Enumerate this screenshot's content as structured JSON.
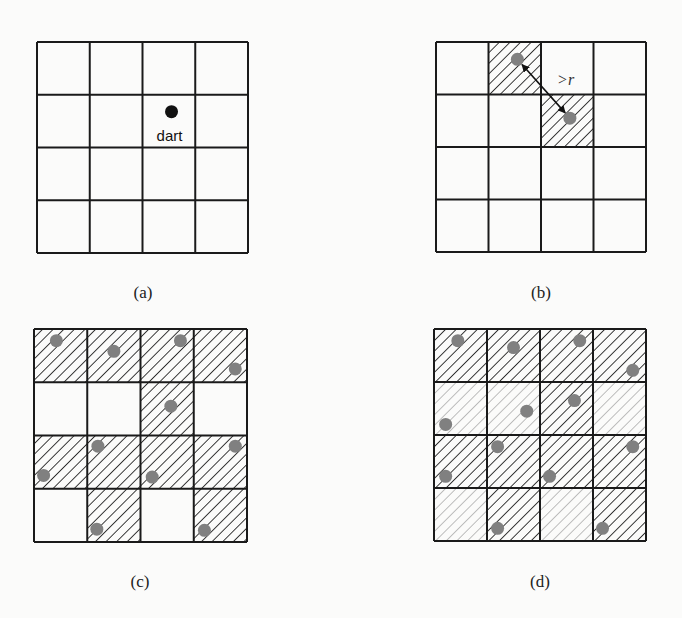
{
  "figure": {
    "grid_size": 4,
    "colors": {
      "grid_line": "#1a1a1a",
      "hatch_dark": "#1a1a1a",
      "hatch_light": "#a8a8a8",
      "dart_black": "#111111",
      "dart_gray": "#808080"
    },
    "panels": [
      {
        "id": "a",
        "caption": "(a)",
        "origin": [
          37,
          42
        ],
        "size": 211,
        "dart_label": "dart",
        "darts": [
          {
            "row": 1,
            "col": 2,
            "fx": 0.55,
            "fy": 0.32,
            "color": "black"
          }
        ],
        "hatched_dark": [],
        "hatched_light": []
      },
      {
        "id": "b",
        "caption": "(b)",
        "origin": [
          436,
          42
        ],
        "size": 210,
        "distance_label": ">r",
        "darts": [
          {
            "row": 0,
            "col": 1,
            "fx": 0.55,
            "fy": 0.33,
            "color": "gray"
          },
          {
            "row": 1,
            "col": 2,
            "fx": 0.55,
            "fy": 0.45,
            "color": "gray"
          }
        ],
        "hatched_dark": [
          [
            0,
            1
          ],
          [
            1,
            2
          ]
        ],
        "hatched_light": []
      },
      {
        "id": "c",
        "caption": "(c)",
        "origin": [
          34,
          329
        ],
        "size": 213,
        "darts": [
          {
            "row": 0,
            "col": 0,
            "fx": 0.42,
            "fy": 0.22
          },
          {
            "row": 0,
            "col": 1,
            "fx": 0.5,
            "fy": 0.42
          },
          {
            "row": 0,
            "col": 2,
            "fx": 0.75,
            "fy": 0.22
          },
          {
            "row": 0,
            "col": 3,
            "fx": 0.78,
            "fy": 0.75
          },
          {
            "row": 1,
            "col": 2,
            "fx": 0.57,
            "fy": 0.45
          },
          {
            "row": 2,
            "col": 0,
            "fx": 0.18,
            "fy": 0.75
          },
          {
            "row": 2,
            "col": 1,
            "fx": 0.2,
            "fy": 0.2
          },
          {
            "row": 2,
            "col": 2,
            "fx": 0.22,
            "fy": 0.78
          },
          {
            "row": 2,
            "col": 3,
            "fx": 0.78,
            "fy": 0.2
          },
          {
            "row": 3,
            "col": 1,
            "fx": 0.18,
            "fy": 0.76
          },
          {
            "row": 3,
            "col": 3,
            "fx": 0.2,
            "fy": 0.78
          }
        ],
        "hatched_dark": [
          [
            0,
            0
          ],
          [
            0,
            1
          ],
          [
            0,
            2
          ],
          [
            0,
            3
          ],
          [
            1,
            2
          ],
          [
            2,
            0
          ],
          [
            2,
            1
          ],
          [
            2,
            2
          ],
          [
            2,
            3
          ],
          [
            3,
            1
          ],
          [
            3,
            3
          ]
        ],
        "hatched_light": []
      },
      {
        "id": "d",
        "caption": "(d)",
        "origin": [
          434,
          329
        ],
        "size": 212,
        "darts": [
          {
            "row": 0,
            "col": 0,
            "fx": 0.45,
            "fy": 0.22
          },
          {
            "row": 0,
            "col": 1,
            "fx": 0.5,
            "fy": 0.35
          },
          {
            "row": 0,
            "col": 2,
            "fx": 0.75,
            "fy": 0.22
          },
          {
            "row": 0,
            "col": 3,
            "fx": 0.75,
            "fy": 0.78
          },
          {
            "row": 1,
            "col": 0,
            "fx": 0.22,
            "fy": 0.8
          },
          {
            "row": 1,
            "col": 1,
            "fx": 0.75,
            "fy": 0.55
          },
          {
            "row": 1,
            "col": 2,
            "fx": 0.65,
            "fy": 0.35
          },
          {
            "row": 2,
            "col": 0,
            "fx": 0.22,
            "fy": 0.78
          },
          {
            "row": 2,
            "col": 1,
            "fx": 0.2,
            "fy": 0.22
          },
          {
            "row": 2,
            "col": 2,
            "fx": 0.18,
            "fy": 0.78
          },
          {
            "row": 2,
            "col": 3,
            "fx": 0.75,
            "fy": 0.22
          },
          {
            "row": 3,
            "col": 1,
            "fx": 0.2,
            "fy": 0.76
          },
          {
            "row": 3,
            "col": 3,
            "fx": 0.18,
            "fy": 0.76
          }
        ],
        "hatched_dark": [
          [
            0,
            0
          ],
          [
            0,
            1
          ],
          [
            0,
            2
          ],
          [
            0,
            3
          ],
          [
            1,
            2
          ],
          [
            2,
            0
          ],
          [
            2,
            1
          ],
          [
            2,
            2
          ],
          [
            2,
            3
          ],
          [
            3,
            1
          ],
          [
            3,
            3
          ]
        ],
        "hatched_light": [
          [
            1,
            0
          ],
          [
            1,
            1
          ],
          [
            1,
            3
          ],
          [
            3,
            0
          ],
          [
            3,
            2
          ]
        ]
      }
    ]
  }
}
